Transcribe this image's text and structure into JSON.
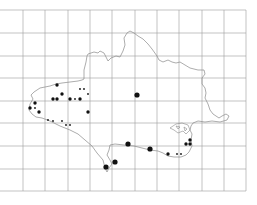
{
  "map": {
    "type": "distribution-map",
    "grid": {
      "color": "#9a9a9a",
      "vertical_x": [
        23,
        45,
        68,
        90,
        112,
        135,
        157,
        179,
        202,
        224,
        246
      ],
      "horizontal_y": [
        10,
        33,
        56,
        78,
        101,
        123,
        146,
        169,
        191
      ],
      "x_range": [
        0,
        246
      ],
      "y_range": [
        10,
        191
      ]
    },
    "outline_color": "#8a8a8a",
    "dot_color": "#111111",
    "records": [
      {
        "x": 57,
        "y": 85,
        "size": "medium"
      },
      {
        "x": 62,
        "y": 94,
        "size": "medium"
      },
      {
        "x": 53,
        "y": 99,
        "size": "medium"
      },
      {
        "x": 57,
        "y": 99,
        "size": "medium"
      },
      {
        "x": 70,
        "y": 99,
        "size": "medium"
      },
      {
        "x": 80,
        "y": 99,
        "size": "medium"
      },
      {
        "x": 75,
        "y": 99,
        "size": "small"
      },
      {
        "x": 80,
        "y": 89,
        "size": "small"
      },
      {
        "x": 84,
        "y": 89,
        "size": "small"
      },
      {
        "x": 88,
        "y": 94,
        "size": "small"
      },
      {
        "x": 35,
        "y": 103,
        "size": "medium"
      },
      {
        "x": 30,
        "y": 108,
        "size": "medium"
      },
      {
        "x": 35,
        "y": 108,
        "size": "small"
      },
      {
        "x": 39,
        "y": 112,
        "size": "medium"
      },
      {
        "x": 88,
        "y": 112,
        "size": "medium"
      },
      {
        "x": 48,
        "y": 120,
        "size": "small"
      },
      {
        "x": 53,
        "y": 121,
        "size": "small"
      },
      {
        "x": 62,
        "y": 121,
        "size": "small"
      },
      {
        "x": 66,
        "y": 125,
        "size": "small"
      },
      {
        "x": 70,
        "y": 125,
        "size": "small"
      },
      {
        "x": 137,
        "y": 95,
        "size": "large"
      },
      {
        "x": 128,
        "y": 144,
        "size": "large"
      },
      {
        "x": 150,
        "y": 149,
        "size": "large"
      },
      {
        "x": 168,
        "y": 154,
        "size": "medium"
      },
      {
        "x": 177,
        "y": 154,
        "size": "small"
      },
      {
        "x": 181,
        "y": 154,
        "size": "small"
      },
      {
        "x": 186,
        "y": 144,
        "size": "medium"
      },
      {
        "x": 190,
        "y": 144,
        "size": "medium"
      },
      {
        "x": 190,
        "y": 140,
        "size": "medium"
      },
      {
        "x": 115,
        "y": 162,
        "size": "large"
      },
      {
        "x": 106,
        "y": 167,
        "size": "large"
      }
    ]
  }
}
